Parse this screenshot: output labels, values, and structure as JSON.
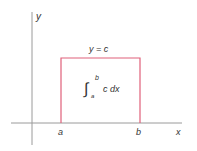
{
  "diagram": {
    "axes": {
      "x_label": "x",
      "y_label": "y"
    },
    "function_label": "y = c",
    "integral": {
      "symbol": "∫",
      "lower": "a",
      "upper": "b",
      "integrand": "c dx"
    },
    "bounds": {
      "a_label": "a",
      "b_label": "b"
    },
    "colors": {
      "axis": "#9a9a9a",
      "curve": "#e0607a",
      "text": "#333333"
    }
  }
}
